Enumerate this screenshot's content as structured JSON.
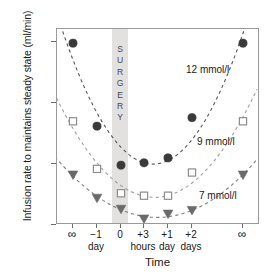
{
  "chart_data": {
    "type": "scatter",
    "title": "",
    "xlabel": "Time",
    "ylabel": "Infusion rate to maintains steady state (ml/min)",
    "x_categories": [
      "∞",
      "−1 day",
      "0",
      "+3 hours",
      "+1 day",
      "+2 days",
      "∞"
    ],
    "x_tick_primary": [
      "∞",
      "−1",
      "0",
      "+3",
      "+1",
      "+2",
      "∞"
    ],
    "x_tick_unit": [
      "",
      "day",
      "",
      "hours",
      "day",
      "days",
      ""
    ],
    "ylim": [
      0,
      16
    ],
    "y_ticks": [
      0,
      5,
      10,
      15
    ],
    "grid": false,
    "legend_position": "inline-annotation",
    "annotation_band": {
      "label": "SURGERY",
      "letters": [
        "S",
        "U",
        "R",
        "G",
        "E",
        "R",
        "Y"
      ],
      "at_category": "0",
      "color": "#e3e1e0"
    },
    "series": [
      {
        "name": "12 mmol/l",
        "marker": "filled-circle",
        "color": "#3a3a3a",
        "values": [
          14.9,
          8.1,
          4.9,
          5.1,
          5.5,
          8.8,
          14.9
        ]
      },
      {
        "name": "9 mmol/l",
        "marker": "open-square",
        "color": "#8e8e8e",
        "values": [
          8.5,
          4.6,
          2.6,
          2.4,
          2.4,
          4.3,
          8.5
        ]
      },
      {
        "name": "7 mmol/l",
        "marker": "filled-triangle-down",
        "color": "#6a6a6a",
        "values": [
          4.1,
          2.2,
          1.3,
          0.5,
          0.9,
          1.2,
          4.1
        ]
      }
    ]
  },
  "annotations": {
    "series_12": "12 mmol/l",
    "series_9": "9 mmol/l",
    "series_7": "7 mmol/l"
  },
  "axis": {
    "y_tick_labels": [
      "15",
      "10",
      "5",
      "0"
    ],
    "x_title": "Time",
    "y_title": "Infusion rate to maintains steady state (ml/min)"
  }
}
